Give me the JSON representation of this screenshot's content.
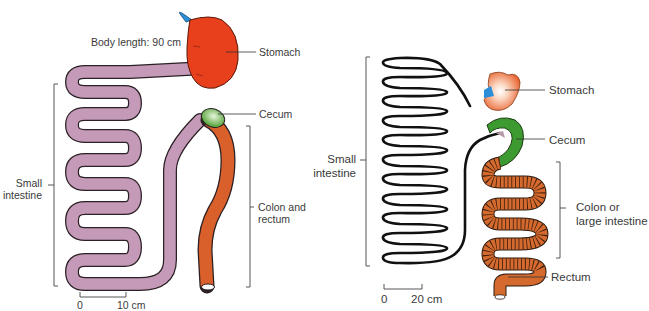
{
  "left_panel": {
    "body_length": "Body length: 90 cm",
    "labels": {
      "stomach": "Stomach",
      "cecum": "Cecum",
      "small_intestine_line1": "Small",
      "small_intestine_line2": "intestine",
      "colon_line1": "Colon and",
      "colon_line2": "rectum"
    },
    "scale": {
      "start": "0",
      "end": "10 cm"
    },
    "colors": {
      "stomach": "#e8401c",
      "esophagus": "#2a8fd8",
      "small_intestine": "#c49ab8",
      "cecum": "#4a9e2e",
      "colon": "#d9602a"
    }
  },
  "right_panel": {
    "labels": {
      "stomach": "Stomach",
      "cecum": "Cecum",
      "small_intestine_line1": "Small",
      "small_intestine_line2": "intestine",
      "colon_line1": "Colon or",
      "colon_line2": "large intestine",
      "rectum": "Rectum"
    },
    "scale": {
      "start": "0",
      "end": "20 cm"
    },
    "colors": {
      "stomach": "#e8602c",
      "esophagus": "#2a8fd8",
      "small_intestine": "#111111",
      "cecum": "#3c9a30",
      "colon": "#d46a2e"
    }
  }
}
